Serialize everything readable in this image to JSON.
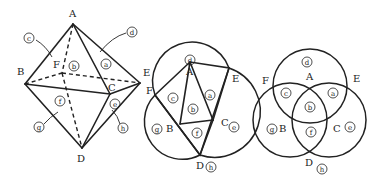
{
  "figures": [
    {
      "id": "octahedron",
      "vertices": [
        {
          "name": "A",
          "x": 73,
          "y": 24,
          "lx": 69,
          "ly": 17
        },
        {
          "name": "B",
          "x": 25,
          "y": 84,
          "lx": 17,
          "ly": 75
        },
        {
          "name": "F",
          "x": 62,
          "y": 73,
          "lx": 53,
          "ly": 68
        },
        {
          "name": "C",
          "x": 110,
          "y": 94,
          "lx": 108,
          "ly": 91
        },
        {
          "name": "E",
          "x": 140,
          "y": 83,
          "lx": 143,
          "ly": 76
        },
        {
          "name": "D",
          "x": 82,
          "y": 148,
          "lx": 77,
          "ly": 162
        }
      ],
      "regions": [
        {
          "name": "a",
          "x": 106,
          "y": 64
        },
        {
          "name": "b",
          "x": 74,
          "y": 66
        },
        {
          "name": "c",
          "x": 29,
          "y": 38
        },
        {
          "name": "d",
          "x": 132,
          "y": 32
        },
        {
          "name": "e",
          "x": 115,
          "y": 104
        },
        {
          "name": "f",
          "x": 60,
          "y": 101
        },
        {
          "name": "g",
          "x": 39,
          "y": 127
        },
        {
          "name": "h",
          "x": 123,
          "y": 128
        }
      ]
    },
    {
      "id": "net-with-circles",
      "vertices": [
        {
          "name": "A",
          "x": 190,
          "y": 62,
          "lx": 186,
          "ly": 75
        },
        {
          "name": "E",
          "x": 229,
          "y": 68,
          "lx": 232,
          "ly": 82
        },
        {
          "name": "F",
          "x": 155,
          "y": 95,
          "lx": 146,
          "ly": 94
        },
        {
          "name": "B",
          "x": 180,
          "y": 124,
          "lx": 166,
          "ly": 132
        },
        {
          "name": "C",
          "x": 213,
          "y": 120,
          "lx": 221,
          "ly": 126
        },
        {
          "name": "D",
          "x": 200,
          "y": 155,
          "lx": 196,
          "ly": 169
        }
      ],
      "regions": [
        {
          "name": "a",
          "x": 210,
          "y": 95
        },
        {
          "name": "b",
          "x": 193,
          "y": 109
        },
        {
          "name": "c",
          "x": 173,
          "y": 98
        },
        {
          "name": "d",
          "x": 190,
          "y": 60
        },
        {
          "name": "e",
          "x": 234,
          "y": 127
        },
        {
          "name": "f",
          "x": 197,
          "y": 133
        },
        {
          "name": "g",
          "x": 157,
          "y": 129
        },
        {
          "name": "h",
          "x": 211,
          "y": 167
        }
      ]
    },
    {
      "id": "venn",
      "vertices": [
        {
          "name": "A",
          "x": 310,
          "y": 80,
          "lx": 306,
          "ly": 80
        },
        {
          "name": "E",
          "x": 352,
          "y": 80,
          "lx": 353,
          "ly": 82
        },
        {
          "name": "F",
          "x": 270,
          "y": 80,
          "lx": 262,
          "ly": 84
        },
        {
          "name": "B",
          "x": 278,
          "y": 128,
          "lx": 279,
          "ly": 132
        },
        {
          "name": "C",
          "x": 334,
          "y": 128,
          "lx": 333,
          "ly": 132
        },
        {
          "name": "D",
          "x": 310,
          "y": 162,
          "lx": 305,
          "ly": 166
        }
      ],
      "regions": [
        {
          "name": "a",
          "x": 333,
          "y": 93
        },
        {
          "name": "b",
          "x": 310,
          "y": 107
        },
        {
          "name": "c",
          "x": 286,
          "y": 93
        },
        {
          "name": "d",
          "x": 307,
          "y": 62
        },
        {
          "name": "e",
          "x": 350,
          "y": 127
        },
        {
          "name": "f",
          "x": 311,
          "y": 132
        },
        {
          "name": "g",
          "x": 272,
          "y": 129
        },
        {
          "name": "h",
          "x": 322,
          "y": 169
        }
      ]
    }
  ]
}
